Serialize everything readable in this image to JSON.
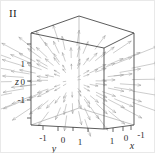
{
  "figure": {
    "panel_label": "II",
    "caption": "",
    "background_color": "#ffffff",
    "border_color": "#e9e9e9"
  },
  "chart_data": {
    "type": "scatter",
    "plot_kind": "3d-vector-field",
    "title": "II",
    "field_formula": "F(x,y,z) = x i + y j + z k",
    "xlabel": "x",
    "ylabel": "y",
    "zlabel": "z",
    "xlim": [
      -1,
      1
    ],
    "ylim": [
      -1,
      1
    ],
    "zlim": [
      -1,
      1
    ],
    "xticks": [
      1,
      0,
      -1
    ],
    "yticks": [
      -1,
      0,
      1
    ],
    "zticks": [
      1,
      0,
      -1
    ],
    "xtick_labels": [
      "1",
      "0",
      "-1"
    ],
    "ytick_labels": [
      "-1",
      "0",
      "1"
    ],
    "ztick_labels": [
      "1",
      "0",
      "-1"
    ],
    "grid": false,
    "legend": false,
    "box_aspect": [
      1,
      1,
      1
    ],
    "arrow_color": "#9a9a9a",
    "box_edge_color": "#4a4a4a",
    "arrow_count": 98,
    "projection": "axonometric"
  },
  "axes": {
    "z": {
      "name": "z",
      "ticks": [
        "1",
        "0",
        "-1"
      ]
    },
    "y": {
      "name": "y",
      "ticks": [
        "-1",
        "0",
        "1"
      ]
    },
    "x": {
      "name": "x",
      "ticks": [
        "1",
        "0",
        "-1"
      ]
    }
  },
  "labels": {
    "z_axis_name": "z",
    "y_axis_name": "y",
    "x_axis_name": "x",
    "z_tick_1": "1",
    "z_tick_0": "0",
    "z_tick_m1": "-1",
    "y_tick_m1": "-1",
    "y_tick_0": "0",
    "y_tick_1": "1",
    "x_tick_1": "1",
    "x_tick_0": "0",
    "x_tick_m1": "-1"
  }
}
